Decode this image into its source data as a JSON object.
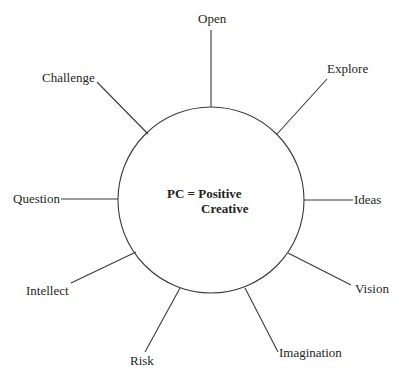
{
  "diagram": {
    "type": "radial-concept-map",
    "center": {
      "line1": "PC = Positive",
      "line2": "Creative"
    },
    "circle": {
      "cx": 211,
      "cy": 200,
      "r": 93
    },
    "stroke_color": "#3a3a3a",
    "text_color": "#231f20",
    "spokes": [
      {
        "label": "Open",
        "x1": 211,
        "y1": 107,
        "x2": 211,
        "y2": 30
      },
      {
        "label": "Explore",
        "x1": 277,
        "y1": 134,
        "x2": 327,
        "y2": 79
      },
      {
        "label": "Ideas",
        "x1": 304,
        "y1": 200,
        "x2": 353,
        "y2": 200
      },
      {
        "label": "Vision",
        "x1": 288,
        "y1": 253,
        "x2": 351,
        "y2": 285
      },
      {
        "label": "Imagination",
        "x1": 245,
        "y1": 288,
        "x2": 278,
        "y2": 352
      },
      {
        "label": "Risk",
        "x1": 180,
        "y1": 288,
        "x2": 145,
        "y2": 352
      },
      {
        "label": "Intellect",
        "x1": 136,
        "y1": 252,
        "x2": 71,
        "y2": 283
      },
      {
        "label": "Question",
        "x1": 118,
        "y1": 199,
        "x2": 61,
        "y2": 199
      },
      {
        "label": "Challenge",
        "x1": 148,
        "y1": 134,
        "x2": 97,
        "y2": 82
      }
    ]
  }
}
